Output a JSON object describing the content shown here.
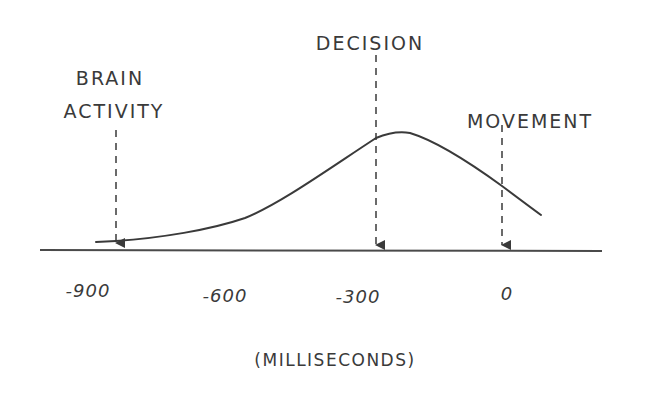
{
  "diagram": {
    "annotations": [
      {
        "id": "brain-activity",
        "lines": [
          "BRAIN",
          "ACTIVITY"
        ],
        "time_ms": -900
      },
      {
        "id": "decision",
        "lines": [
          "DECISION"
        ],
        "time_ms": -300
      },
      {
        "id": "movement",
        "lines": [
          "MOVEMENT"
        ],
        "time_ms": 0
      }
    ],
    "axis": {
      "ticks": [
        "-900",
        "-600",
        "-300",
        "0"
      ],
      "unit_label": "(MILLISECONDS)"
    },
    "colors": {
      "ink": "#3a3a3a",
      "background": "#ffffff"
    }
  }
}
